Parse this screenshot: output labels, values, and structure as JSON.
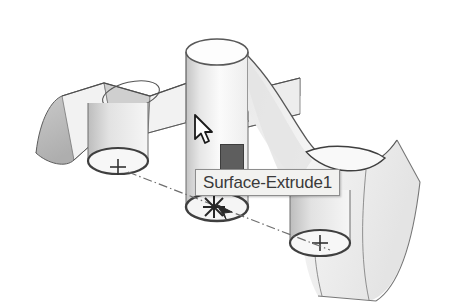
{
  "app": {
    "view_type": "3d-model-viewport",
    "background_color": "#ffffff"
  },
  "tooltip": {
    "label": "Surface-Extrude1",
    "background_color": "#f2f2f0",
    "border_color": "#8d8d8d",
    "text_color": "#3a3a3a",
    "x": 195,
    "y": 169
  },
  "selection_badge": {
    "name": "face-selection-swatch",
    "fill_color": "#5e5e5e",
    "border_color": "#3d3d3d",
    "x": 220,
    "y": 144
  },
  "cursor": {
    "type": "arrow-pointer",
    "fill_color": "#ffffff",
    "outline_color": "#1a1a1a",
    "x": 193,
    "y": 114
  },
  "geometry": {
    "outline_color": "#4a4a4a",
    "light_face_color": "#f4f4f4",
    "mid_face_color": "#d5d5d5",
    "dark_face_color": "#b4b4b4",
    "centerline_color": "#6e6e6e",
    "features": [
      {
        "name": "wavy-lofted-surface",
        "description": "corrugated ruled surface spanning left to right"
      },
      {
        "name": "vertical-cylinder-upper",
        "description": "cylinder rising above the wavy surface"
      },
      {
        "name": "draped-surface-right",
        "description": "surface draping down toward lower right"
      },
      {
        "name": "cylinder-left",
        "description": "cylinder below left wave crest"
      },
      {
        "name": "cylinder-middle",
        "description": "cylinder below center"
      },
      {
        "name": "cylinder-right",
        "description": "cylinder at lower right"
      }
    ],
    "sketch_points": [
      {
        "name": "center-mark-left",
        "marker": "plus",
        "x": 118,
        "y": 167
      },
      {
        "name": "center-mark-right",
        "marker": "plus",
        "x": 320,
        "y": 243
      },
      {
        "name": "snap-marker-middle",
        "marker": "asterisk",
        "x": 214,
        "y": 207
      }
    ],
    "centerlines": [
      {
        "name": "axis-centerline",
        "style": "dash-dot",
        "from_x": 128,
        "from_y": 172,
        "to_x": 330,
        "to_y": 250
      }
    ]
  }
}
